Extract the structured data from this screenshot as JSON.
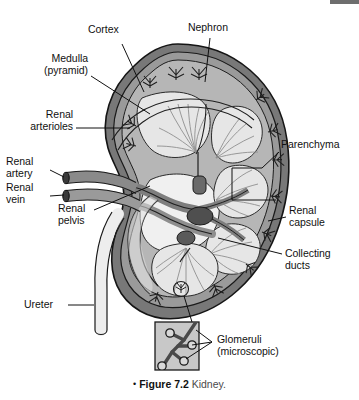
{
  "figure": {
    "title": "Kidney",
    "caption_bullet": "•",
    "caption_number": "Figure 7.2",
    "caption_text": "Kidney."
  },
  "labels": [
    {
      "id": "cortex",
      "text": "Cortex",
      "lines": [
        "Cortex"
      ]
    },
    {
      "id": "nephron",
      "text": "Nephron",
      "lines": [
        "Nephron"
      ]
    },
    {
      "id": "medulla",
      "text": "Medulla (pyramid)",
      "lines": [
        "Medulla",
        "(pyramid)"
      ]
    },
    {
      "id": "renal-arterioles",
      "text": "Renal arterioles",
      "lines": [
        "Renal",
        "arterioles"
      ]
    },
    {
      "id": "renal-artery",
      "text": "Renal artery",
      "lines": [
        "Renal",
        "artery"
      ]
    },
    {
      "id": "renal-vein",
      "text": "Renal vein",
      "lines": [
        "Renal",
        "vein"
      ]
    },
    {
      "id": "renal-pelvis",
      "text": "Renal pelvis",
      "lines": [
        "Renal",
        "pelvis"
      ]
    },
    {
      "id": "ureter",
      "text": "Ureter",
      "lines": [
        "Ureter"
      ]
    },
    {
      "id": "parenchyma",
      "text": "Parenchyma",
      "lines": [
        "Parenchyma"
      ]
    },
    {
      "id": "renal-capsule",
      "text": "Renal capsule",
      "lines": [
        "Renal",
        "capsule"
      ]
    },
    {
      "id": "collecting-ducts",
      "text": "Collecting ducts",
      "lines": [
        "Collecting",
        "ducts"
      ]
    },
    {
      "id": "glomeruli",
      "text": "Glomeruli (microscopic)",
      "lines": [
        "Glomeruli",
        "(microscopic)"
      ]
    }
  ],
  "label_text": {
    "cortex": "Cortex",
    "nephron": "Nephron",
    "medulla_l1": "Medulla",
    "medulla_l2": "(pyramid)",
    "arterioles_l1": "Renal",
    "arterioles_l2": "arterioles",
    "artery_l1": "Renal",
    "artery_l2": "artery",
    "vein_l1": "Renal",
    "vein_l2": "vein",
    "pelvis_l1": "Renal",
    "pelvis_l2": "pelvis",
    "ureter": "Ureter",
    "parenchyma": "Parenchyma",
    "capsule_l1": "Renal",
    "capsule_l2": "capsule",
    "ducts_l1": "Collecting",
    "ducts_l2": "ducts",
    "glomeruli_l1": "Glomeruli",
    "glomeruli_l2": "(microscopic)"
  },
  "colors": {
    "capsule_outer": "#6f6f6f",
    "capsule_inner": "#8c8c8c",
    "cortex": "#b3b3b3",
    "parenchyma": "#bdbdbd",
    "pyramid": "#e2e2e2",
    "pelvis_fill": "#f2f2f2",
    "vessel": "#8a8a8a",
    "vessel_dark": "#4a4a4a",
    "ureter": "#ededed",
    "inset_fill": "#c6c6c6",
    "outline": "#1a1a1a",
    "text": "#111111",
    "artifact_bar": "#6e6e6e"
  },
  "inset": {
    "name": "glomeruli-inset",
    "glomerulus_count": 4
  }
}
